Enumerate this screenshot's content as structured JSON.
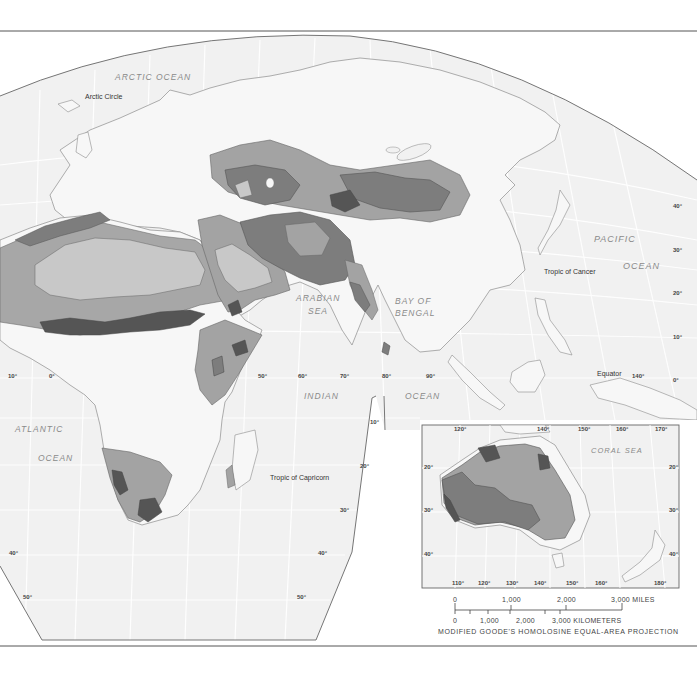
{
  "map": {
    "projection_label": "MODIFIED GOODE'S HOMOLOSINE EQUAL-AREA PROJECTION",
    "colors": {
      "background": "#ffffff",
      "ocean": "#f1f1f1",
      "land": "#f7f7f7",
      "border": "#8c8c8c",
      "shade_light": "#c8c8c8",
      "shade_medium": "#a3a3a3",
      "shade_dark": "#7d7d7d",
      "shade_darkest": "#555555"
    },
    "water_labels": {
      "arctic_ocean": "ARCTIC OCEAN",
      "pacific_ocean_1": "PACIFIC",
      "pacific_ocean_2": "OCEAN",
      "arabian_sea_1": "ARABIAN",
      "arabian_sea_2": "SEA",
      "bay_of_bengal_1": "BAY OF",
      "bay_of_bengal_2": "BENGAL",
      "indian_ocean_1": "INDIAN",
      "indian_ocean_2": "OCEAN",
      "atlantic_ocean_1": "ATLANTIC",
      "atlantic_ocean_2": "OCEAN",
      "coral_sea": "CORAL SEA"
    },
    "line_labels": {
      "arctic_circle": "Arctic Circle",
      "tropic_of_cancer": "Tropic of Cancer",
      "equator": "Equator",
      "tropic_of_capricorn": "Tropic of Capricorn"
    },
    "longitude_ticks_main": [
      "10°",
      "0°",
      "50°",
      "60°",
      "70°",
      "80°",
      "90°",
      "140°"
    ],
    "latitude_ticks_right": [
      "40°",
      "30°",
      "20°",
      "10°",
      "0°"
    ],
    "latitude_ticks_south_right": [
      "10°",
      "20°",
      "30°",
      "40°",
      "50°"
    ],
    "latitude_ticks_south_left": [
      "40°",
      "50°"
    ],
    "inset": {
      "top_ticks": [
        "120°",
        "140°",
        "150°",
        "160°",
        "170°"
      ],
      "bottom_ticks": [
        "110°",
        "120°",
        "130°",
        "140°",
        "150°",
        "160°",
        "180°"
      ],
      "left_ticks": [
        "20°",
        "30°",
        "40°"
      ],
      "right_ticks": [
        "20°",
        "30°",
        "40°"
      ]
    },
    "scale_bar": {
      "miles": [
        "0",
        "1,000",
        "2,000",
        "3,000 MILES"
      ],
      "kilometers": [
        "0",
        "1,000",
        "2,000",
        "3,000 KILOMETERS"
      ]
    }
  }
}
